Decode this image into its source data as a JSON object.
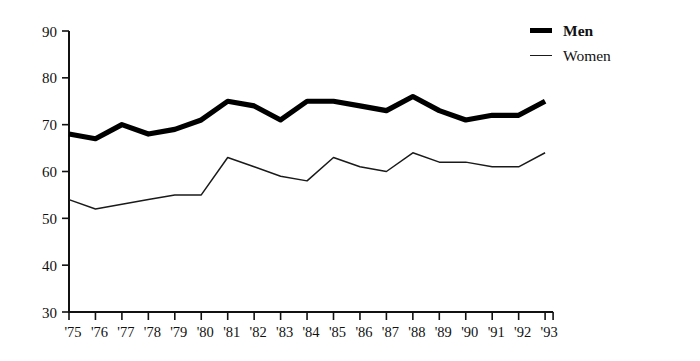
{
  "chart_data": {
    "type": "line",
    "title": "",
    "subtitle": "",
    "xlabel": "",
    "ylabel": "",
    "categories": [
      "'75",
      "'76",
      "'77",
      "'78",
      "'79",
      "'80",
      "'81",
      "'82",
      "'83",
      "'84",
      "'85",
      "'86",
      "'87",
      "'88",
      "'89",
      "'90",
      "'91",
      "'92",
      "'93"
    ],
    "x_tick_labels": [
      "'75",
      "'76",
      "'77",
      "'78",
      "'79",
      "'80",
      "'81",
      "'82",
      "'83",
      "'84",
      "'85",
      "'86",
      "'87",
      "'88",
      "'89",
      "'90",
      "'91",
      "'92",
      "'93"
    ],
    "y_tick_labels": [
      "30",
      "40",
      "50",
      "60",
      "70",
      "80",
      "90"
    ],
    "y_ticks": [
      30,
      40,
      50,
      60,
      70,
      80,
      90
    ],
    "ylim": [
      30,
      90
    ],
    "grid": false,
    "legend_position": "top-right",
    "series": [
      {
        "name": "Men",
        "style": "thick",
        "color": "#000000",
        "values": [
          68,
          67,
          70,
          68,
          69,
          71,
          75,
          74,
          71,
          75,
          75,
          74,
          73,
          76,
          73,
          71,
          72,
          72,
          75
        ]
      },
      {
        "name": "Women",
        "style": "thin",
        "color": "#1a1a1a",
        "values": [
          54,
          52,
          53,
          54,
          55,
          55,
          63,
          61,
          59,
          58,
          63,
          61,
          60,
          64,
          62,
          62,
          61,
          61,
          64
        ]
      }
    ]
  },
  "legend": {
    "items": [
      {
        "label": "Men"
      },
      {
        "label": "Women"
      }
    ]
  }
}
